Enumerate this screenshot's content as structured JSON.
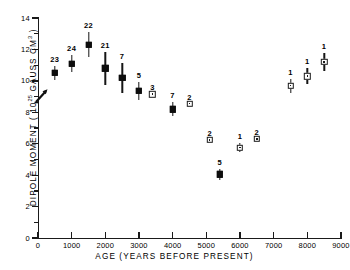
{
  "chart_data": {
    "type": "scatter",
    "title": "",
    "xlabel": "AGE (YEARS BEFORE PRESENT)",
    "ylabel_text": "DIPOLE MOMENT  ( 10",
    "ylabel_sup": "25",
    "ylabel_tail": " GAUSS  CM",
    "ylabel_sup2": "3",
    "ylabel_end": " )",
    "xlim": [
      0,
      9000
    ],
    "ylim": [
      0,
      14
    ],
    "xticks": [
      0,
      1000,
      2000,
      3000,
      4000,
      5000,
      6000,
      7000,
      8000,
      9000
    ],
    "xticklabels": [
      "0",
      "1000",
      "2000",
      "3000",
      "4000",
      "5000",
      "6000",
      "7000",
      "8000",
      "9000"
    ],
    "yticks": [
      0,
      2,
      4,
      6,
      8,
      10,
      12,
      14
    ],
    "yticklabels": [
      "0",
      "2",
      "4",
      "6",
      "8",
      "10",
      "12",
      "14"
    ],
    "yticks_minor": [
      1,
      3,
      5,
      7,
      9,
      11,
      13
    ],
    "grid": false,
    "legend": "none",
    "annotation_arrow": "present-day-field-arrow",
    "series": [
      {
        "name": "filled-squares",
        "marker": "filled-square",
        "points": [
          {
            "x": 500,
            "y": 10.5,
            "yerr": 0.45,
            "n": "23"
          },
          {
            "x": 1000,
            "y": 11.1,
            "yerr": 0.55,
            "n": "24"
          },
          {
            "x": 1500,
            "y": 12.3,
            "yerr": 0.8,
            "n": "22"
          },
          {
            "x": 2000,
            "y": 10.8,
            "yerr": 1.05,
            "n": "21"
          },
          {
            "x": 2500,
            "y": 10.2,
            "yerr": 0.95,
            "n": "7"
          },
          {
            "x": 3000,
            "y": 9.35,
            "yerr": 0.55,
            "n": "5"
          },
          {
            "x": 4000,
            "y": 8.2,
            "yerr": 0.45,
            "n": "7"
          },
          {
            "x": 5400,
            "y": 4.05,
            "yerr": 0.35,
            "n": "5"
          }
        ]
      },
      {
        "name": "open-squares",
        "marker": "open-square",
        "points": [
          {
            "x": 3400,
            "y": 9.15,
            "yerr": 0.0,
            "n": "3"
          },
          {
            "x": 4500,
            "y": 8.55,
            "yerr": 0.0,
            "n": "2"
          },
          {
            "x": 5100,
            "y": 6.25,
            "yerr": 0.0,
            "n": "2"
          },
          {
            "x": 6000,
            "y": 5.75,
            "yerr": 0.3,
            "n": "1"
          },
          {
            "x": 6500,
            "y": 6.3,
            "yerr": 0.0,
            "n": "2"
          },
          {
            "x": 7500,
            "y": 9.7,
            "yerr": 0.45,
            "n": "1"
          },
          {
            "x": 8000,
            "y": 10.3,
            "yerr": 0.5,
            "n": "1"
          },
          {
            "x": 8500,
            "y": 11.2,
            "yerr": 0.55,
            "n": "1"
          }
        ]
      }
    ]
  }
}
